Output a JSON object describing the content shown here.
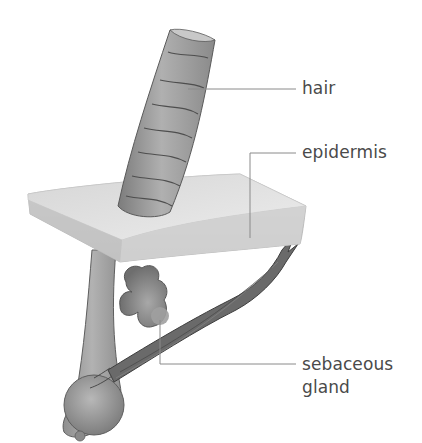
{
  "diagram": {
    "labels": {
      "hair": "hair",
      "epidermis": "epidermis",
      "sebaceous_line1": "sebaceous",
      "sebaceous_line2": "gland"
    },
    "colors": {
      "hair_fill": "#9a9a9a",
      "hair_edge": "#5e5e5e",
      "epidermis_top": "#e2e2e2",
      "epidermis_side": "#c4c4c4",
      "gland_fill": "#8a8a8a",
      "muscle_fill": "#6a6a6a",
      "leader_line": "#8a8a8a",
      "label_text": "#4a4a4a"
    }
  }
}
